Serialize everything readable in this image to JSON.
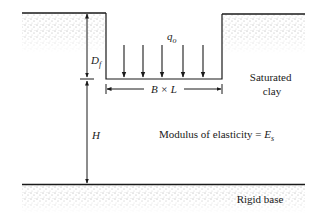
{
  "diagram": {
    "type": "shallow-foundation-on-saturated-clay",
    "labels": {
      "embedment_depth": "D",
      "embedment_depth_sub": "f",
      "load": "q",
      "load_sub": "o",
      "foundation_size": "B × L",
      "layer_thickness": "H",
      "soil_line1": "Saturated",
      "soil_line2": "clay",
      "modulus_text": "Modulus of elasticity = ",
      "modulus_symbol": "E",
      "modulus_sub": "s",
      "base": "Rigid base"
    },
    "load_arrow_count": 5,
    "colors": {
      "line": "#1a1a1a",
      "stipple": "#555555",
      "background": "#ffffff"
    }
  }
}
